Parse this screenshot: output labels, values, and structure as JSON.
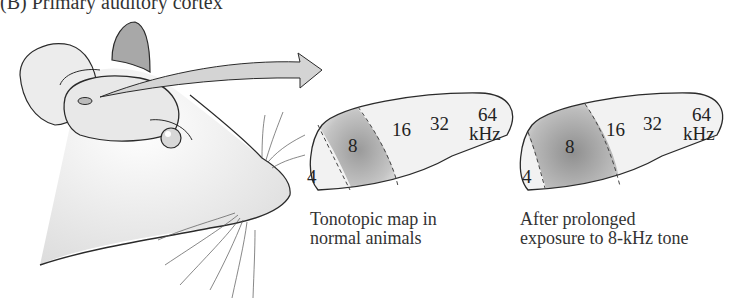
{
  "figure": {
    "title": "(B) Primary auditory cortex",
    "maps": [
      {
        "id": "normal",
        "caption_line1": "Tonotopic map in",
        "caption_line2": "normal animals",
        "labels": {
          "f4": "4",
          "f8": "8",
          "f16": "16",
          "f32": "32",
          "f64": "64",
          "unit": "kHz"
        }
      },
      {
        "id": "exposed",
        "caption_line1": "After prolonged",
        "caption_line2": "exposure to 8-kHz tone",
        "labels": {
          "f4": "4",
          "f8": "8",
          "f16": "16",
          "f32": "32",
          "f64": "64",
          "unit": "kHz"
        }
      }
    ],
    "colors": {
      "outline": "#2a2a2a",
      "fill": "#f0f0f0",
      "highlight": "#9a9a9a",
      "arrow": "#d4d4d4"
    }
  }
}
